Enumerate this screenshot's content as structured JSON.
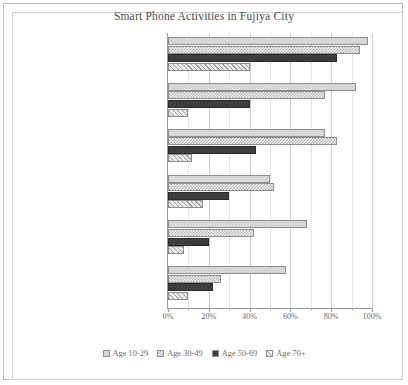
{
  "chart_data": {
    "type": "bar",
    "orientation": "horizontal",
    "title": "Smart Phone Activities in Fujiya City",
    "xlabel": "",
    "ylabel": "",
    "xlim": [
      0,
      100
    ],
    "xtick_labels": [
      "0%",
      "20%",
      "40%",
      "60%",
      "80%",
      "100%"
    ],
    "xtick_values": [
      0,
      20,
      40,
      60,
      80,
      100
    ],
    "xtick_minor_values": [
      10,
      30,
      50,
      70,
      90
    ],
    "grid": true,
    "legend_position": "bottom",
    "categories": [
      "Getting directions",
      "Streaming music",
      "Shopping online",
      "Checking sports scores",
      "Participating in video calls",
      "Streaming movies/TV programs"
    ],
    "series": [
      {
        "name": "Age 10-29",
        "pattern": "light-gray-solid",
        "values": [
          98,
          92,
          77,
          50,
          68,
          58
        ]
      },
      {
        "name": "Age 30-49",
        "pattern": "fine-checker",
        "values": [
          94,
          77,
          83,
          52,
          42,
          26
        ]
      },
      {
        "name": "Age 50-69",
        "pattern": "dark-solid",
        "values": [
          83,
          40,
          43,
          30,
          20,
          22
        ]
      },
      {
        "name": "Age 70+",
        "pattern": "diagonal-hatch",
        "values": [
          40,
          10,
          12,
          17,
          8,
          10
        ]
      }
    ]
  }
}
